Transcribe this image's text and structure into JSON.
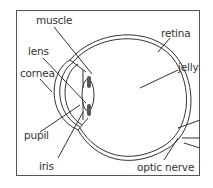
{
  "diagram": {
    "labels": {
      "muscle": "muscle",
      "lens": "lens",
      "cornea": "cornea",
      "pupil": "pupil",
      "iris": "iris",
      "retina": "retina",
      "jelly": "jelly",
      "optic_nerve": "optic nerve"
    },
    "colors": {
      "line": "#333333",
      "muscle_fill": "#555555",
      "border": "#555555",
      "background": "#ffffff"
    }
  }
}
